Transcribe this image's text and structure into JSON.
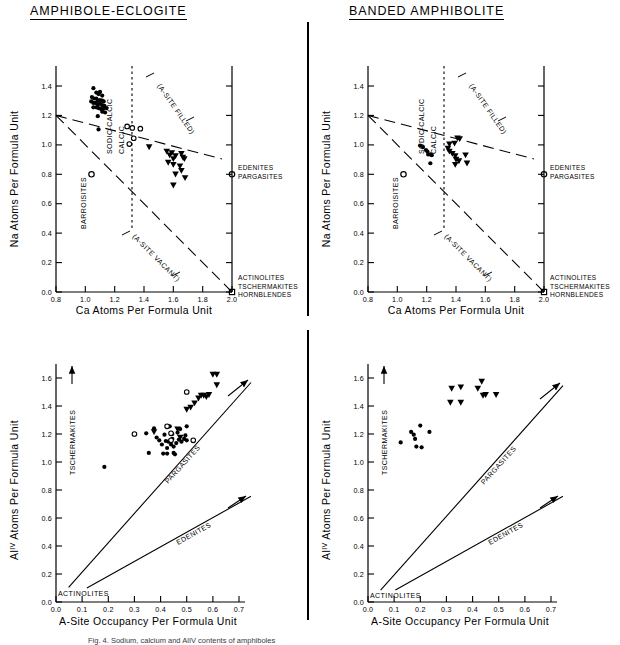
{
  "figure": {
    "divider_label": "vertical-rule",
    "caption": "Fig. 4. Sodium, calcium and AlIV contents of amphiboles"
  },
  "panels": [
    {
      "id": "amphibole-eclogite-na-ca",
      "title": "AMPHIBOLE-ECLOGITE",
      "show_title": true
    },
    {
      "id": "banded-amphibolite-na-ca",
      "title": "BANDED AMPHIBOLITE",
      "show_title": true
    },
    {
      "id": "amphibole-eclogite-al-asite",
      "title": "",
      "show_title": false
    },
    {
      "id": "banded-amphibolite-al-asite",
      "title": "",
      "show_title": false
    }
  ],
  "chart_data": [
    {
      "type": "scatter",
      "panel": "top-left",
      "title": "AMPHIBOLE-ECLOGITE",
      "xlabel": "Ca Atoms Per Formula Unit",
      "ylabel": "Na Atoms Per Formula Unit",
      "xlim": [
        0.8,
        2.0
      ],
      "ylim": [
        0.0,
        1.5
      ],
      "xticks": [
        0.8,
        1.0,
        1.2,
        1.4,
        1.6,
        1.8,
        2.0
      ],
      "xticklabels": [
        "0.8",
        "1.0",
        "1.2",
        "1.4",
        "1.6",
        "1.8",
        "2.0"
      ],
      "yticks": [
        0.0,
        0.2,
        0.4,
        0.6,
        0.8,
        1.0,
        1.2,
        1.4
      ],
      "yticklabels": [
        "0.0",
        "0.2",
        "0.4",
        "0.6",
        "0.8",
        "1.0",
        "1.2",
        "1.4"
      ],
      "grid": false,
      "legend": "none",
      "annotations": [
        {
          "text": "BARROISITES",
          "kind": "field",
          "orient": "vertical"
        },
        {
          "text": "SODIC-CALCIC",
          "kind": "field",
          "orient": "vertical"
        },
        {
          "text": "CALCIC",
          "kind": "field",
          "orient": "vertical"
        },
        {
          "text": "(A-SITE FILLED)",
          "kind": "boundary",
          "orient": "diagonal"
        },
        {
          "text": "(A-SITE VACANT)",
          "kind": "boundary",
          "orient": "diagonal"
        },
        {
          "text": "EDENITES",
          "kind": "endmember"
        },
        {
          "text": "PARGASITES",
          "kind": "endmember"
        },
        {
          "text": "ACTINOLITES",
          "kind": "endmember"
        },
        {
          "text": "TSCHERMAKITES",
          "kind": "endmember"
        },
        {
          "text": "HORNBLENDES",
          "kind": "endmember"
        }
      ],
      "reference_markers": [
        {
          "label": "BARROISITES",
          "marker": "open-circle",
          "x": 0.93,
          "y": 1.0
        },
        {
          "label": "EDENITES/PARGASITES",
          "marker": "open-circle",
          "x": 2.0,
          "y": 1.0
        },
        {
          "label": "ACTINOLITES/TSCHERMAKITES/HORNBLENDES",
          "marker": "open-square",
          "x": 2.0,
          "y": 0.0
        }
      ],
      "series": [
        {
          "name": "filled-circle",
          "marker": "filled-circle",
          "points": [
            [
              1.055,
              1.385
            ],
            [
              1.075,
              1.355
            ],
            [
              1.09,
              1.345
            ],
            [
              1.1,
              1.36
            ],
            [
              1.115,
              1.335
            ],
            [
              1.045,
              1.325
            ],
            [
              1.06,
              1.315
            ],
            [
              1.075,
              1.315
            ],
            [
              1.085,
              1.3
            ],
            [
              1.1,
              1.305
            ],
            [
              1.115,
              1.3
            ],
            [
              1.125,
              1.295
            ],
            [
              1.04,
              1.295
            ],
            [
              1.055,
              1.285
            ],
            [
              1.07,
              1.285
            ],
            [
              1.085,
              1.275
            ],
            [
              1.1,
              1.28
            ],
            [
              1.115,
              1.27
            ],
            [
              1.13,
              1.265
            ],
            [
              1.055,
              1.255
            ],
            [
              1.075,
              1.255
            ],
            [
              1.09,
              1.25
            ],
            [
              1.105,
              1.245
            ],
            [
              1.125,
              1.245
            ],
            [
              1.115,
              1.225
            ],
            [
              1.135,
              1.22
            ],
            [
              1.145,
              1.25
            ],
            [
              1.085,
              1.195
            ],
            [
              1.09,
              1.105
            ]
          ]
        },
        {
          "name": "open-circle",
          "marker": "open-circle",
          "points": [
            [
              1.285,
              1.125
            ],
            [
              1.32,
              1.115
            ],
            [
              1.375,
              1.11
            ],
            [
              1.33,
              1.045
            ],
            [
              1.3,
              1.005
            ]
          ]
        },
        {
          "name": "filled-triangle",
          "marker": "filled-triangle-down",
          "points": [
            [
              1.435,
              0.985
            ],
            [
              1.555,
              0.955
            ],
            [
              1.575,
              0.93
            ],
            [
              1.59,
              0.945
            ],
            [
              1.6,
              0.905
            ],
            [
              1.615,
              0.925
            ],
            [
              1.655,
              0.94
            ],
            [
              1.665,
              0.915
            ],
            [
              1.675,
              0.905
            ],
            [
              1.565,
              0.88
            ],
            [
              1.6,
              0.865
            ],
            [
              1.645,
              0.855
            ],
            [
              1.655,
              0.825
            ],
            [
              1.615,
              0.8
            ],
            [
              1.68,
              0.775
            ],
            [
              1.6,
              0.725
            ]
          ]
        }
      ]
    },
    {
      "type": "scatter",
      "panel": "top-right",
      "title": "BANDED AMPHIBOLITE",
      "xlabel": "Ca Atoms Per Formula Unit",
      "ylabel": "Na Atoms Per Formula Unit",
      "xlim": [
        0.8,
        2.0
      ],
      "ylim": [
        0.0,
        1.5
      ],
      "xticks": [
        0.8,
        1.0,
        1.2,
        1.4,
        1.6,
        1.8,
        2.0
      ],
      "xticklabels": [
        "0.8",
        "1.0",
        "1.2",
        "1.4",
        "1.6",
        "1.8",
        "2.0"
      ],
      "yticks": [
        0.0,
        0.2,
        0.4,
        0.6,
        0.8,
        1.0,
        1.2,
        1.4
      ],
      "yticklabels": [
        "0.0",
        "0.2",
        "0.4",
        "0.6",
        "0.8",
        "1.0",
        "1.2",
        "1.4"
      ],
      "grid": false,
      "legend": "none",
      "annotations": [
        {
          "text": "BARROISITES",
          "kind": "field",
          "orient": "vertical"
        },
        {
          "text": "SODIC-CALCIC",
          "kind": "field",
          "orient": "vertical"
        },
        {
          "text": "CALCIC",
          "kind": "field",
          "orient": "vertical"
        },
        {
          "text": "(A-SITE FILLED)",
          "kind": "boundary",
          "orient": "diagonal"
        },
        {
          "text": "(A-SITE VACANT)",
          "kind": "boundary",
          "orient": "diagonal"
        },
        {
          "text": "EDENITES",
          "kind": "endmember"
        },
        {
          "text": "PARGASITES",
          "kind": "endmember"
        },
        {
          "text": "ACTINOLITES",
          "kind": "endmember"
        },
        {
          "text": "TSCHERMAKITES",
          "kind": "endmember"
        },
        {
          "text": "HORNBLENDES",
          "kind": "endmember"
        }
      ],
      "reference_markers": [
        {
          "label": "BARROISITES",
          "marker": "open-circle",
          "x": 0.93,
          "y": 1.0
        },
        {
          "label": "EDENITES/PARGASITES",
          "marker": "open-circle",
          "x": 2.0,
          "y": 1.0
        },
        {
          "label": "ACTINOLITES/TSCHERMAKITES/HORNBLENDES",
          "marker": "open-square",
          "x": 2.0,
          "y": 0.0
        }
      ],
      "series": [
        {
          "name": "filled-circle",
          "marker": "filled-circle",
          "points": [
            [
              1.155,
              0.995
            ],
            [
              1.175,
              0.985
            ],
            [
              1.195,
              0.965
            ],
            [
              1.205,
              0.955
            ],
            [
              1.21,
              0.935
            ],
            [
              1.225,
              0.935
            ],
            [
              1.235,
              0.93
            ],
            [
              1.225,
              0.875
            ]
          ]
        },
        {
          "name": "filled-triangle",
          "marker": "filled-triangle-down",
          "points": [
            [
              1.355,
              1.005
            ],
            [
              1.39,
              1.01
            ],
            [
              1.41,
              1.045
            ],
            [
              1.425,
              1.04
            ],
            [
              1.345,
              0.975
            ],
            [
              1.355,
              0.955
            ],
            [
              1.375,
              0.94
            ],
            [
              1.395,
              0.925
            ],
            [
              1.4,
              0.9
            ],
            [
              1.42,
              0.89
            ],
            [
              1.465,
              0.93
            ],
            [
              1.395,
              0.865
            ],
            [
              1.475,
              0.875
            ]
          ]
        }
      ]
    },
    {
      "type": "scatter",
      "panel": "bottom-left",
      "title": "",
      "xlabel": "A-Site Occupancy Per Formula Unit",
      "ylabel": "AlIV Atoms Per Formula Unit",
      "xlim": [
        0.0,
        0.75
      ],
      "ylim": [
        0.0,
        1.72
      ],
      "xticks": [
        0.0,
        0.1,
        0.2,
        0.3,
        0.4,
        0.5,
        0.6,
        0.7
      ],
      "xticklabels": [
        "0.0",
        "0.1",
        "0.2",
        "0.3",
        "0.4",
        "0.5",
        "0.6",
        "0.7"
      ],
      "yticks": [
        0.0,
        0.2,
        0.4,
        0.6,
        0.8,
        1.0,
        1.2,
        1.4,
        1.6
      ],
      "yticklabels": [
        "0.0",
        "0.2",
        "0.4",
        "0.6",
        "0.8",
        "1.0",
        "1.2",
        "1.4",
        "1.6"
      ],
      "grid": false,
      "legend": "none",
      "annotations": [
        {
          "text": "TSCHERMAKITES",
          "kind": "axis-arrow",
          "orient": "vertical"
        },
        {
          "text": "PARGASITES",
          "kind": "trend-line"
        },
        {
          "text": "EDENITES",
          "kind": "trend-line"
        },
        {
          "text": "ACTINOLITES",
          "kind": "origin"
        }
      ],
      "trend_lines": [
        {
          "name": "PARGASITES",
          "from": [
            0.048,
            0.105
          ],
          "to": [
            0.745,
            1.575
          ]
        },
        {
          "name": "EDENITES",
          "from": [
            0.118,
            0.1
          ],
          "to": [
            0.745,
            0.755
          ]
        }
      ],
      "series": [
        {
          "name": "filled-circle",
          "marker": "filled-circle",
          "points": [
            [
              0.185,
              0.965
            ],
            [
              0.345,
              1.205
            ],
            [
              0.355,
              1.065
            ],
            [
              0.375,
              1.24
            ],
            [
              0.385,
              1.175
            ],
            [
              0.395,
              1.155
            ],
            [
              0.405,
              1.125
            ],
            [
              0.41,
              1.06
            ],
            [
              0.415,
              1.195
            ],
            [
              0.42,
              1.15
            ],
            [
              0.425,
              1.1
            ],
            [
              0.43,
              1.145
            ],
            [
              0.435,
              1.255
            ],
            [
              0.44,
              1.125
            ],
            [
              0.445,
              1.2
            ],
            [
              0.445,
              1.165
            ],
            [
              0.45,
              1.11
            ],
            [
              0.455,
              1.055
            ],
            [
              0.46,
              1.135
            ],
            [
              0.465,
              1.21
            ],
            [
              0.47,
              1.16
            ],
            [
              0.475,
              1.235
            ],
            [
              0.48,
              1.145
            ],
            [
              0.49,
              1.165
            ],
            [
              0.495,
              1.19
            ],
            [
              0.5,
              1.155
            ],
            [
              0.5,
              1.255
            ],
            [
              0.425,
              1.06
            ],
            [
              0.45,
              1.065
            ]
          ]
        },
        {
          "name": "open-circle",
          "marker": "open-circle",
          "points": [
            [
              0.3,
              1.2
            ],
            [
              0.425,
              1.255
            ],
            [
              0.44,
              1.205
            ],
            [
              0.44,
              1.155
            ],
            [
              0.5,
              1.5
            ],
            [
              0.525,
              1.155
            ]
          ]
        },
        {
          "name": "filled-triangle",
          "marker": "filled-triangle-down",
          "points": [
            [
              0.375,
              1.215
            ],
            [
              0.465,
              1.235
            ],
            [
              0.475,
              1.175
            ],
            [
              0.5,
              1.375
            ],
            [
              0.515,
              1.39
            ],
            [
              0.53,
              1.42
            ],
            [
              0.545,
              1.455
            ],
            [
              0.555,
              1.475
            ],
            [
              0.565,
              1.475
            ],
            [
              0.575,
              1.465
            ],
            [
              0.585,
              1.48
            ],
            [
              0.6,
              1.625
            ],
            [
              0.615,
              1.625
            ],
            [
              0.615,
              1.55
            ]
          ]
        }
      ]
    },
    {
      "type": "scatter",
      "panel": "bottom-right",
      "title": "",
      "xlabel": "A-Site Occupancy Per Formula Unit",
      "ylabel": "AlIV Atoms Per Formula Unit",
      "xlim": [
        0.0,
        0.75
      ],
      "ylim": [
        0.0,
        1.72
      ],
      "xticks": [
        0.0,
        0.1,
        0.2,
        0.3,
        0.4,
        0.5,
        0.6,
        0.7
      ],
      "xticklabels": [
        "0.0",
        "0.1",
        "0.2",
        "0.3",
        "0.4",
        "0.5",
        "0.6",
        "0.7"
      ],
      "yticks": [
        0.0,
        0.2,
        0.4,
        0.6,
        0.8,
        1.0,
        1.2,
        1.4,
        1.6
      ],
      "yticklabels": [
        "0.0",
        "0.2",
        "0.4",
        "0.6",
        "0.8",
        "1.0",
        "1.2",
        "1.4",
        "1.6"
      ],
      "grid": false,
      "legend": "none",
      "annotations": [
        {
          "text": "TSCHERMAKITES",
          "kind": "axis-arrow",
          "orient": "vertical"
        },
        {
          "text": "PARGASITES",
          "kind": "trend-line"
        },
        {
          "text": "EDENITES",
          "kind": "trend-line"
        },
        {
          "text": "ACTINOLITES",
          "kind": "origin"
        }
      ],
      "trend_lines": [
        {
          "name": "PARGASITES",
          "from": [
            0.048,
            0.085
          ],
          "to": [
            0.745,
            1.545
          ]
        },
        {
          "name": "EDENITES",
          "from": [
            0.105,
            0.085
          ],
          "to": [
            0.745,
            0.755
          ]
        }
      ],
      "series": [
        {
          "name": "filled-circle",
          "marker": "filled-circle",
          "points": [
            [
              0.125,
              1.14
            ],
            [
              0.165,
              1.215
            ],
            [
              0.175,
              1.195
            ],
            [
              0.18,
              1.165
            ],
            [
              0.185,
              1.11
            ],
            [
              0.2,
              1.26
            ],
            [
              0.205,
              1.105
            ],
            [
              0.235,
              1.215
            ]
          ]
        },
        {
          "name": "filled-triangle",
          "marker": "filled-triangle-down",
          "points": [
            [
              0.32,
              1.525
            ],
            [
              0.315,
              1.425
            ],
            [
              0.355,
              1.535
            ],
            [
              0.355,
              1.425
            ],
            [
              0.42,
              1.525
            ],
            [
              0.435,
              1.575
            ],
            [
              0.44,
              1.475
            ],
            [
              0.45,
              1.48
            ],
            [
              0.49,
              1.48
            ]
          ]
        }
      ]
    }
  ]
}
